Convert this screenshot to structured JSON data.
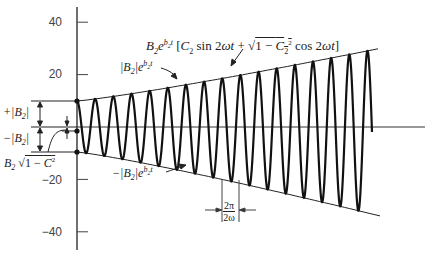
{
  "diagram": {
    "title": "",
    "y_axis": {
      "ticks": [
        {
          "value": 40,
          "label": "40"
        },
        {
          "value": 20,
          "label": "20"
        },
        {
          "value": -20,
          "label": "−20"
        },
        {
          "value": -40,
          "label": "−40"
        }
      ],
      "range": [
        -45,
        46
      ]
    },
    "annotations": {
      "main_formula": {
        "prefix": "B",
        "prefix_sub": "2",
        "exp": "b",
        "exp_sub": "2",
        "exp_t": "t",
        "body": "[C₂ sin 2ωt + √(1 − C₂²) cos 2ωt]"
      },
      "upper_envelope": "|B₂| e^(b₂t)",
      "lower_envelope": "−|B₂| e^(b₂t)",
      "plus_b2": "+|B₂|",
      "minus_b2": "−|B₂|",
      "initial_value": "B₂ √(1 − C²)",
      "period_numerator": "2π",
      "period_denominator": "2ω"
    },
    "waveform": {
      "amplitude_start": 10,
      "amplitude_end": 33,
      "cycles": 16,
      "initial_offset": 0.4
    }
  },
  "chart_data": {
    "type": "line",
    "xlabel": "t",
    "ylabel": "",
    "ylim": [
      -45,
      46
    ],
    "yticks": [
      40,
      20,
      -20,
      -40
    ],
    "series": [
      {
        "name": "oscillation",
        "description": "sinusoid with exponentially growing envelope, ~16 cycles, amplitude ~10 at t=0 rising to ~33"
      },
      {
        "name": "upper envelope |B₂|e^(b₂t)",
        "values_start_end": [
          10,
          32
        ]
      },
      {
        "name": "lower envelope −|B₂|e^(b₂t)",
        "values_start_end": [
          -10,
          -34
        ]
      }
    ],
    "annotations": [
      "+|B₂|",
      "−|B₂|",
      "B₂√(1−C²)",
      "period 2π/2ω"
    ]
  }
}
